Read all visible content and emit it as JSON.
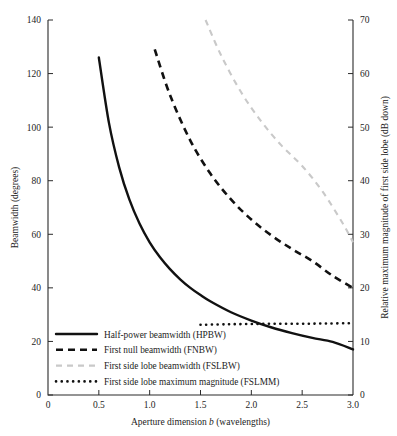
{
  "chart_data": {
    "type": "line",
    "title": "",
    "xlabel": "Aperture dimension b (wavelengths)",
    "xlabel_plain": "Aperture dimension",
    "xlabel_italic": "b",
    "xlabel_tail": "(wavelengths)",
    "ylabel": "Beamwidth (degrees)",
    "ylabel_right": "Relative maximum magnitude of first side lobe (dB down)",
    "xlim": [
      0,
      3.0
    ],
    "ylim": [
      0,
      140
    ],
    "ylim_right": [
      0,
      70
    ],
    "grid": false,
    "legend_position": "lower-left-inside",
    "xticks": [
      0,
      0.5,
      1.0,
      1.5,
      2.0,
      2.5,
      3.0
    ],
    "xticklabels": [
      "0",
      "0.5",
      "1.0",
      "1.5",
      "2.0",
      "2.5",
      "3.0"
    ],
    "yticks": [
      0,
      20,
      40,
      60,
      80,
      100,
      120,
      140
    ],
    "yticklabels": [
      "0",
      "20",
      "40",
      "60",
      "80",
      "100",
      "120",
      "140"
    ],
    "yticks_right": [
      0,
      10,
      20,
      30,
      40,
      50,
      60,
      70
    ],
    "yticklabels_right": [
      "0",
      "10",
      "20",
      "30",
      "40",
      "50",
      "60",
      "70"
    ],
    "series": [
      {
        "name": "Half-power beamwidth (HPBW)",
        "key": "hpbw",
        "style": "solid",
        "color": "#111111",
        "axis": "left",
        "x": [
          0.5,
          0.6,
          0.7,
          0.8,
          0.9,
          1.0,
          1.1,
          1.2,
          1.3,
          1.4,
          1.5,
          1.6,
          1.8,
          2.0,
          2.2,
          2.4,
          2.6,
          2.8,
          3.0
        ],
        "values": [
          126.0,
          101.5,
          85.0,
          73.0,
          64.0,
          57.0,
          51.5,
          47.0,
          43.2,
          40.0,
          37.3,
          34.9,
          30.9,
          27.8,
          25.2,
          23.1,
          21.3,
          19.8,
          17.0
        ]
      },
      {
        "name": "First null beamwidth (FNBW)",
        "key": "fnbw",
        "style": "dashed",
        "color": "#111111",
        "axis": "left",
        "x": [
          1.05,
          1.2,
          1.4,
          1.6,
          1.8,
          2.0,
          2.2,
          2.4,
          2.6,
          2.8,
          3.0
        ],
        "values": [
          129.0,
          112.0,
          95.0,
          82.5,
          73.0,
          65.5,
          59.5,
          54.5,
          50.0,
          44.5,
          40.0
        ]
      },
      {
        "name": "First side lobe beamwidth (FSLBW)",
        "key": "fslbw",
        "style": "dashed-light",
        "color": "#c9c9c9",
        "axis": "left",
        "x": [
          1.55,
          1.7,
          1.9,
          2.1,
          2.3,
          2.5,
          2.7,
          2.9,
          3.0
        ],
        "values": [
          140.0,
          127.0,
          113.0,
          102.0,
          93.0,
          85.5,
          76.0,
          64.0,
          57.0
        ]
      },
      {
        "name": "First side lobe maximum magnitude (FSLMM)",
        "key": "fslmm",
        "style": "dotted",
        "color": "#111111",
        "axis": "right",
        "x": [
          1.5,
          1.75,
          2.0,
          2.25,
          2.5,
          2.75,
          3.0
        ],
        "values": [
          13.1,
          13.2,
          13.25,
          13.3,
          13.3,
          13.35,
          13.4
        ]
      }
    ],
    "legend": [
      {
        "label": "Half-power beamwidth (HPBW)",
        "style": "solid",
        "color": "#111111"
      },
      {
        "label": "First null beamwidth (FNBW)",
        "style": "dashed",
        "color": "#111111"
      },
      {
        "label": "First side lobe beamwidth (FSLBW)",
        "style": "dashed-light",
        "color": "#c9c9c9"
      },
      {
        "label": "First side lobe maximum magnitude (FSLMM)",
        "style": "dotted",
        "color": "#111111"
      }
    ]
  }
}
